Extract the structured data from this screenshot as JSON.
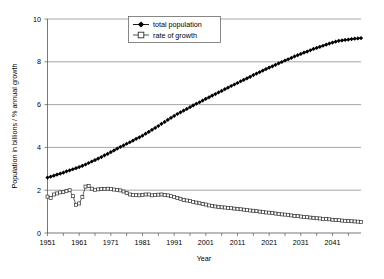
{
  "chart_data": {
    "type": "line",
    "title": "",
    "xlabel": "Year",
    "ylabel": "Population in billions / % annual growth",
    "xlim": [
      1951,
      2050
    ],
    "ylim": [
      0,
      10
    ],
    "xticks": [
      1951,
      1961,
      1971,
      1981,
      1991,
      2001,
      2011,
      2021,
      2031,
      2041
    ],
    "yticks": [
      0,
      2,
      4,
      6,
      8,
      10
    ],
    "grid": "horizontal",
    "legend_position": "top-center",
    "x": [
      1951,
      1952,
      1953,
      1954,
      1955,
      1956,
      1957,
      1958,
      1959,
      1960,
      1961,
      1962,
      1963,
      1964,
      1965,
      1966,
      1967,
      1968,
      1969,
      1970,
      1971,
      1972,
      1973,
      1974,
      1975,
      1976,
      1977,
      1978,
      1979,
      1980,
      1981,
      1982,
      1983,
      1984,
      1985,
      1986,
      1987,
      1988,
      1989,
      1990,
      1991,
      1992,
      1993,
      1994,
      1995,
      1996,
      1997,
      1998,
      1999,
      2000,
      2001,
      2002,
      2003,
      2004,
      2005,
      2006,
      2007,
      2008,
      2009,
      2010,
      2011,
      2012,
      2013,
      2014,
      2015,
      2016,
      2017,
      2018,
      2019,
      2020,
      2021,
      2022,
      2023,
      2024,
      2025,
      2026,
      2027,
      2028,
      2029,
      2030,
      2031,
      2032,
      2033,
      2034,
      2035,
      2036,
      2037,
      2038,
      2039,
      2040,
      2041,
      2042,
      2043,
      2044,
      2045,
      2046,
      2047,
      2048,
      2049,
      2050
    ],
    "series": [
      {
        "name": "total population",
        "marker": "filled-diamond",
        "color": "#000000",
        "values": [
          2.59,
          2.63,
          2.68,
          2.73,
          2.77,
          2.82,
          2.88,
          2.93,
          2.98,
          3.03,
          3.08,
          3.14,
          3.2,
          3.27,
          3.34,
          3.41,
          3.48,
          3.55,
          3.63,
          3.7,
          3.78,
          3.86,
          3.94,
          4.02,
          4.09,
          4.17,
          4.24,
          4.32,
          4.4,
          4.47,
          4.55,
          4.64,
          4.73,
          4.82,
          4.91,
          5.0,
          5.1,
          5.19,
          5.29,
          5.38,
          5.47,
          5.56,
          5.64,
          5.72,
          5.8,
          5.88,
          5.96,
          6.04,
          6.11,
          6.19,
          6.27,
          6.34,
          6.42,
          6.49,
          6.57,
          6.64,
          6.72,
          6.79,
          6.87,
          6.94,
          7.01,
          7.09,
          7.16,
          7.23,
          7.3,
          7.38,
          7.45,
          7.52,
          7.59,
          7.66,
          7.73,
          7.79,
          7.86,
          7.93,
          7.99,
          8.06,
          8.12,
          8.18,
          8.25,
          8.31,
          8.37,
          8.43,
          8.48,
          8.54,
          8.6,
          8.65,
          8.7,
          8.75,
          8.8,
          8.85,
          8.9,
          8.94,
          8.98,
          9.0,
          9.02,
          9.04,
          9.06,
          9.08,
          9.09,
          9.11
        ]
      },
      {
        "name": "rate of growth",
        "marker": "open-square",
        "color": "#404040",
        "values": [
          1.7,
          1.63,
          1.8,
          1.85,
          1.9,
          1.92,
          1.96,
          2.0,
          1.72,
          1.32,
          1.38,
          1.68,
          2.17,
          2.19,
          2.07,
          2.02,
          2.04,
          2.06,
          2.06,
          2.07,
          2.05,
          2.03,
          2.01,
          1.99,
          1.94,
          1.87,
          1.8,
          1.78,
          1.78,
          1.76,
          1.77,
          1.8,
          1.8,
          1.76,
          1.77,
          1.79,
          1.8,
          1.77,
          1.76,
          1.72,
          1.68,
          1.64,
          1.6,
          1.55,
          1.52,
          1.49,
          1.45,
          1.42,
          1.39,
          1.36,
          1.33,
          1.29,
          1.26,
          1.24,
          1.22,
          1.2,
          1.19,
          1.17,
          1.16,
          1.14,
          1.13,
          1.11,
          1.09,
          1.07,
          1.05,
          1.04,
          1.02,
          1.0,
          0.98,
          0.96,
          0.95,
          0.93,
          0.91,
          0.89,
          0.87,
          0.86,
          0.84,
          0.82,
          0.8,
          0.79,
          0.77,
          0.75,
          0.74,
          0.72,
          0.71,
          0.69,
          0.68,
          0.66,
          0.65,
          0.64,
          0.62,
          0.61,
          0.6,
          0.58,
          0.57,
          0.56,
          0.55,
          0.54,
          0.53,
          0.52
        ]
      }
    ],
    "legend": [
      {
        "label": "total population",
        "marker": "filled-diamond"
      },
      {
        "label": "rate of growth",
        "marker": "open-square"
      }
    ],
    "colors": {
      "population": "#000000",
      "growth": "#404040",
      "grid": "#7f7f7f",
      "axis": "#555555",
      "background": "#ffffff"
    }
  },
  "axis": {
    "y_title": "Population in billions / % annual growth",
    "x_title": "Year",
    "y_tick_0": "0",
    "y_tick_1": "2",
    "y_tick_2": "4",
    "y_tick_3": "6",
    "y_tick_4": "8",
    "y_tick_5": "10",
    "x_tick_0": "1951",
    "x_tick_1": "1961",
    "x_tick_2": "1971",
    "x_tick_3": "1981",
    "x_tick_4": "1991",
    "x_tick_5": "2001",
    "x_tick_6": "2011",
    "x_tick_7": "2021",
    "x_tick_8": "2031",
    "x_tick_9": "2041"
  },
  "legend": {
    "item_0": "total population",
    "item_1": "rate of growth"
  }
}
